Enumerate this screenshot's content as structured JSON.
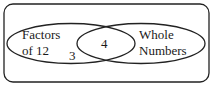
{
  "diagram": {
    "type": "venn",
    "universe": {
      "label": ""
    },
    "sets": [
      {
        "name": "left",
        "label_line1": "Factors",
        "label_line2": "of 12"
      },
      {
        "name": "right",
        "label_line1": "Whole",
        "label_line2": "Numbers"
      }
    ],
    "regions": {
      "left_only": "3",
      "intersection": "4",
      "right_only": ""
    }
  }
}
